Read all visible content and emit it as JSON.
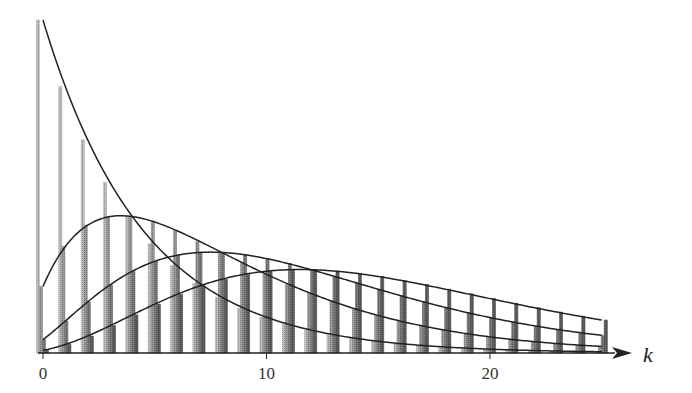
{
  "chart_data": {
    "type": "bar",
    "title": "",
    "xlabel": "k",
    "ylabel": "",
    "x": [
      0,
      1,
      2,
      3,
      4,
      5,
      6,
      7,
      8,
      9,
      10,
      11,
      12,
      13,
      14,
      15,
      16,
      17,
      18,
      19,
      20,
      21,
      22,
      23,
      24,
      25
    ],
    "xticks": [
      "0",
      "10",
      "20"
    ],
    "xlim": [
      -0.2,
      26.5
    ],
    "ylim": [
      0,
      0.2
    ],
    "grid": false,
    "legend": "none",
    "series": [
      {
        "name": "r=1",
        "color": "#bdbdbd",
        "values": [
          0.2,
          0.16,
          0.128,
          0.1024,
          0.0819,
          0.0655,
          0.0524,
          0.0419,
          0.0336,
          0.0268,
          0.0215,
          0.0172,
          0.0137,
          0.011,
          0.0088,
          0.007,
          0.0056,
          0.0045,
          0.0036,
          0.0029,
          0.0023,
          0.0018,
          0.0015,
          0.0012,
          0.0009,
          0.0008
        ]
      },
      {
        "name": "r=2",
        "color": "#9a9a9a",
        "values": [
          0.04,
          0.064,
          0.0768,
          0.0819,
          0.0819,
          0.0786,
          0.0734,
          0.0671,
          0.0604,
          0.0537,
          0.0472,
          0.0412,
          0.0357,
          0.0308,
          0.0264,
          0.0225,
          0.0192,
          0.0163,
          0.0138,
          0.0115,
          0.0097,
          0.0081,
          0.0068,
          0.0057,
          0.0047,
          0.0039
        ]
      },
      {
        "name": "r=3",
        "color": "#7a7a7a",
        "values": [
          0.008,
          0.0192,
          0.0307,
          0.041,
          0.0492,
          0.0551,
          0.0587,
          0.0604,
          0.0604,
          0.0591,
          0.0567,
          0.0536,
          0.05,
          0.0462,
          0.0422,
          0.0383,
          0.0344,
          0.0308,
          0.0274,
          0.0242,
          0.0213,
          0.0187,
          0.0163,
          0.0142,
          0.0123,
          0.0106
        ]
      },
      {
        "name": "r=4",
        "color": "#5e5e5e",
        "values": [
          0.0016,
          0.0051,
          0.0102,
          0.0164,
          0.0229,
          0.0294,
          0.0352,
          0.0403,
          0.0443,
          0.0472,
          0.0491,
          0.05,
          0.05,
          0.0493,
          0.0479,
          0.046,
          0.0436,
          0.0411,
          0.0384,
          0.0355,
          0.0327,
          0.0299,
          0.0272,
          0.0246,
          0.0221,
          0.0198
        ]
      }
    ],
    "curves": [
      {
        "name": "curve-r1",
        "shape": 1
      },
      {
        "name": "curve-r2",
        "shape": 2
      },
      {
        "name": "curve-r3",
        "shape": 3
      },
      {
        "name": "curve-r4",
        "shape": 4
      }
    ],
    "curve_range": [
      0,
      25
    ]
  }
}
